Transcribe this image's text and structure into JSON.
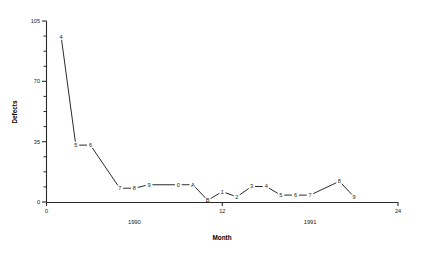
{
  "chart_data": {
    "type": "line",
    "title": "",
    "xlabel": "Month",
    "ylabel": "Defects",
    "xlim": [
      0,
      24
    ],
    "ylim": [
      0,
      105
    ],
    "grid": false,
    "legend": null,
    "y_ticks": [
      0,
      35,
      70,
      105
    ],
    "y_tick_labels": [
      "0",
      "35",
      "70",
      "105"
    ],
    "y_minor_tick_step": 8.75,
    "x_ticks": [
      0,
      12,
      24
    ],
    "x_tick_labels": [
      "0",
      "12",
      "24"
    ],
    "era_labels": [
      {
        "text": "1990",
        "x": 6
      },
      {
        "text": "1991",
        "x": 18
      }
    ],
    "point_label_note": "Each plotted point is annotated with its month-of-year code: 1-9 then 0 for October, A for November, B for December.",
    "x": [
      1,
      2,
      3,
      4,
      5,
      6,
      7,
      8,
      9,
      10,
      11,
      12,
      13,
      14,
      15,
      16,
      17,
      18,
      19,
      20,
      21,
      22,
      23
    ],
    "values": [
      96,
      33,
      33,
      8,
      8,
      10,
      10,
      10,
      6,
      1,
      6,
      3,
      8,
      10,
      5,
      5,
      5,
      5,
      5,
      12,
      4,
      4,
      4
    ],
    "point_labels": [
      "4",
      "5",
      "6",
      "7",
      "8",
      "9",
      "0",
      "A",
      "B",
      "1",
      "2",
      "3",
      "4",
      "5",
      "6",
      "7",
      "8",
      "9"
    ]
  },
  "chart_series": [
    {
      "label": "4",
      "month_index": 1,
      "value": 96
    },
    {
      "label": "5",
      "month_index": 2,
      "value": 33
    },
    {
      "label": "6",
      "month_index": 3,
      "value": 33
    },
    {
      "label": "7",
      "month_index": 5,
      "value": 8
    },
    {
      "label": "8",
      "month_index": 6,
      "value": 8
    },
    {
      "label": "9",
      "month_index": 7,
      "value": 10
    },
    {
      "label": "0",
      "month_index": 9,
      "value": 10
    },
    {
      "label": "A",
      "month_index": 10,
      "value": 10
    },
    {
      "label": "B",
      "month_index": 11,
      "value": 1
    },
    {
      "label": "1",
      "month_index": 12,
      "value": 6
    },
    {
      "label": "2",
      "month_index": 13,
      "value": 3
    },
    {
      "label": "3",
      "month_index": 14,
      "value": 9
    },
    {
      "label": "4",
      "month_index": 15,
      "value": 9
    },
    {
      "label": "5",
      "month_index": 16,
      "value": 4
    },
    {
      "label": "6",
      "month_index": 17,
      "value": 4
    },
    {
      "label": "7",
      "month_index": 18,
      "value": 4
    },
    {
      "label": "8",
      "month_index": 20,
      "value": 12
    },
    {
      "label": "9",
      "month_index": 21,
      "value": 3
    }
  ],
  "colors": {
    "line": "#2b2b2b",
    "axis": "#2a2a2a",
    "text": "#1a1a1a",
    "background": "#ffffff"
  }
}
